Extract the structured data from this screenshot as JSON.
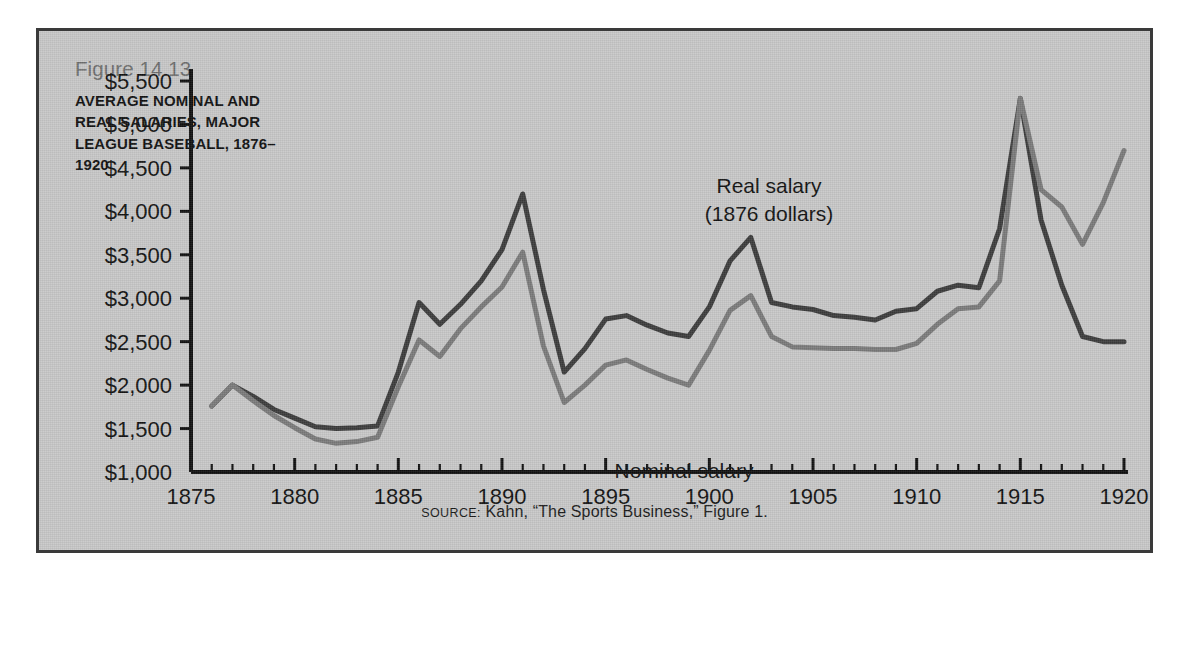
{
  "figure": {
    "number": "Figure 14.13",
    "title": "AVERAGE NOMINAL AND REAL SALARIES, MAJOR LEAGUE BASEBALL, 1876–1920",
    "source_label": "SOURCE:",
    "source_text": " Kahn, “The Sports Business,” Figure 1."
  },
  "colors": {
    "background": "#c8c8c8",
    "border": "#3a3a3a",
    "axis": "#111111",
    "real_line": "#3c3c3c",
    "nominal_line": "#7b7b7b",
    "title_number": "#6f6f6f",
    "title_text": "#111111"
  },
  "annotations": [
    {
      "name": "real-salary-label",
      "lines": [
        "Real salary",
        "(1876 dollars)"
      ],
      "x": 730,
      "y": 162
    },
    {
      "name": "nominal-salary-label",
      "lines": [
        "Nominal salary"
      ],
      "x": 645,
      "y": 447
    }
  ],
  "chart_data": {
    "type": "line",
    "title": "AVERAGE NOMINAL AND REAL SALARIES, MAJOR LEAGUE BASEBALL, 1876–1920",
    "xlabel": "",
    "ylabel": "",
    "xlim": [
      1875,
      1920
    ],
    "ylim": [
      1000,
      5500
    ],
    "grid": false,
    "legend_position": "inline-annotation",
    "x_tick_labels": [
      "1875",
      "1880",
      "1885",
      "1890",
      "1895",
      "1900",
      "1905",
      "1910",
      "1915",
      "1920"
    ],
    "x_tick_values": [
      1875,
      1880,
      1885,
      1890,
      1895,
      1900,
      1905,
      1910,
      1915,
      1920
    ],
    "x_minor_tick_step": 1,
    "y_tick_labels": [
      "$1,000",
      "$1,500",
      "$2,000",
      "$2,500",
      "$3,000",
      "$3,500",
      "$4,000",
      "$4,500",
      "$5,000",
      "$5,500"
    ],
    "y_tick_values": [
      1000,
      1500,
      2000,
      2500,
      3000,
      3500,
      4000,
      4500,
      5000,
      5500
    ],
    "x": [
      1876,
      1877,
      1878,
      1879,
      1880,
      1881,
      1882,
      1883,
      1884,
      1885,
      1886,
      1887,
      1888,
      1889,
      1890,
      1891,
      1892,
      1893,
      1894,
      1895,
      1896,
      1897,
      1898,
      1899,
      1900,
      1901,
      1902,
      1903,
      1904,
      1905,
      1906,
      1907,
      1908,
      1909,
      1910,
      1911,
      1912,
      1913,
      1914,
      1915,
      1916,
      1917,
      1918,
      1919,
      1920
    ],
    "series": [
      {
        "name": "Real salary (1876 dollars)",
        "color": "#3c3c3c",
        "values": [
          1760,
          2000,
          1870,
          1720,
          1620,
          1520,
          1500,
          1510,
          1530,
          2150,
          2950,
          2700,
          2930,
          3200,
          3560,
          4200,
          3100,
          2150,
          2420,
          2760,
          2800,
          2690,
          2600,
          2560,
          2900,
          3430,
          3700,
          2950,
          2900,
          2870,
          2800,
          2780,
          2750,
          2850,
          2880,
          3080,
          3150,
          3120,
          3800,
          5300,
          3900,
          3150,
          2560,
          2500,
          2500
        ]
      },
      {
        "name": "Nominal salary",
        "color": "#7b7b7b",
        "values": [
          1760,
          2000,
          1820,
          1650,
          1510,
          1380,
          1330,
          1350,
          1400,
          1980,
          2520,
          2330,
          2650,
          2900,
          3130,
          3530,
          2450,
          1800,
          2000,
          2230,
          2290,
          2180,
          2080,
          2000,
          2400,
          2860,
          3030,
          2560,
          2440,
          2430,
          2420,
          2420,
          2410,
          2410,
          2480,
          2700,
          2880,
          2900,
          3200,
          5300,
          4250,
          4050,
          3620,
          4100,
          4700
        ]
      }
    ]
  }
}
